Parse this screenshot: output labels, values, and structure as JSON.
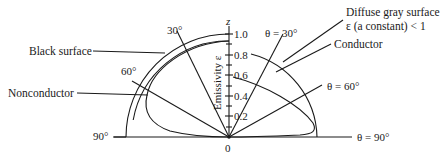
{
  "labels": {
    "black_surface": "Black surface",
    "nonconductor": "Nonconductor",
    "diffuse_gray_line1": "Diffuse gray surface",
    "diffuse_gray_line2": "ε (a constant) < 1",
    "conductor": "Conductor",
    "axis_z": "z",
    "axis_title": "Emissivity ε",
    "origin": "0"
  },
  "left_angles": [
    "30°",
    "60°",
    "90°"
  ],
  "right_angles": [
    "θ = 30°",
    "θ = 60°",
    "θ = 90°"
  ],
  "axis_ticks": [
    "1.0",
    "0.8",
    "0.6",
    "0.4",
    "0.2"
  ],
  "colors": {
    "line": "#1a1a1a",
    "background": "#ffffff"
  }
}
